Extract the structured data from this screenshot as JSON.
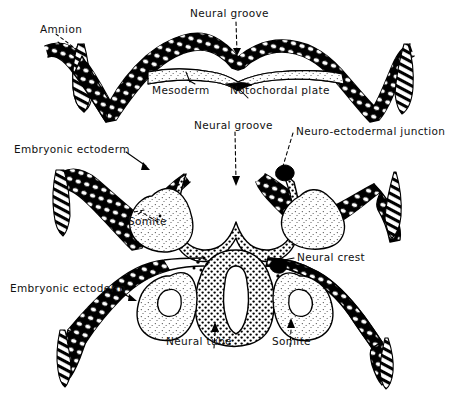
{
  "figure": {
    "background_color": "#ffffff",
    "ink_color": "#000000",
    "panel_count": 3
  },
  "panels": [
    {
      "id": "panel-top",
      "stage_label": "Neural groove stage",
      "labels": [
        {
          "id": "amnion",
          "text": "Amnion",
          "x": 40,
          "y": 24
        },
        {
          "id": "neural-groove",
          "text": "Neural groove",
          "x": 190,
          "y": 8
        },
        {
          "id": "mesoderm",
          "text": "Mesoderm",
          "x": 152,
          "y": 85
        },
        {
          "id": "notochordal-plate",
          "text": "Notochordal plate",
          "x": 230,
          "y": 85
        }
      ]
    },
    {
      "id": "panel-middle",
      "stage_label": "Neural fold stage",
      "labels": [
        {
          "id": "embryonic-ectoderm-mid",
          "text": "Embryonic ectoderm",
          "x": 14,
          "y": 144
        },
        {
          "id": "neural-groove-mid",
          "text": "Neural groove",
          "x": 194,
          "y": 120
        },
        {
          "id": "neuro-ectodermal-junction",
          "text": "Neuro-ectodermal junction",
          "x": 296,
          "y": 126
        },
        {
          "id": "somite-mid",
          "text": "Somite",
          "x": 128,
          "y": 216
        }
      ]
    },
    {
      "id": "panel-bottom",
      "stage_label": "Neural tube stage",
      "labels": [
        {
          "id": "embryonic-ectoderm-bottom",
          "text": "Embryonic ectoderm",
          "x": 10,
          "y": 283
        },
        {
          "id": "neural-crest",
          "text": "Neural crest",
          "x": 297,
          "y": 252
        },
        {
          "id": "neural-tube",
          "text": "Neural tube",
          "x": 166,
          "y": 336
        },
        {
          "id": "somite-bottom",
          "text": "Somite",
          "x": 272,
          "y": 336
        }
      ]
    }
  ]
}
